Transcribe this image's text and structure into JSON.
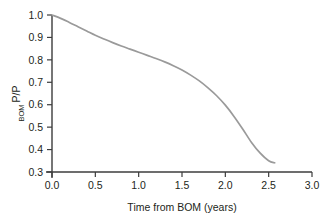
{
  "chart_data": {
    "type": "line",
    "title": "",
    "subtitle": "",
    "xlabel": "Time from BOM (years)",
    "ylabel_main": "P/P",
    "ylabel_sub": "BOM",
    "ylabel": "P/P_BOM",
    "xlim": [
      0.0,
      3.0
    ],
    "ylim": [
      0.3,
      1.0
    ],
    "grid": false,
    "legend": "none",
    "line_color": "#9a9a9a",
    "axis_color": "#3c3c3c",
    "text_color": "#231f20",
    "xticks": [
      "0.0",
      "0.5",
      "1.0",
      "1.5",
      "2.0",
      "2.5",
      "3.0"
    ],
    "xtick_values": [
      0.0,
      0.5,
      1.0,
      1.5,
      2.0,
      2.5,
      3.0
    ],
    "yticks": [
      "0.3",
      "0.4",
      "0.5",
      "0.6",
      "0.7",
      "0.8",
      "0.9",
      "1.0"
    ],
    "ytick_values": [
      0.3,
      0.4,
      0.5,
      0.6,
      0.7,
      0.8,
      0.9,
      1.0
    ],
    "series": [
      {
        "name": "P/P_BOM decline",
        "x": [
          0.0,
          0.1,
          0.2,
          0.3,
          0.4,
          0.5,
          0.6,
          0.7,
          0.8,
          0.9,
          1.0,
          1.1,
          1.2,
          1.3,
          1.4,
          1.5,
          1.6,
          1.7,
          1.8,
          1.9,
          2.0,
          2.1,
          2.2,
          2.3,
          2.4,
          2.5,
          2.57
        ],
        "values": [
          1.0,
          0.985,
          0.967,
          0.948,
          0.929,
          0.91,
          0.893,
          0.877,
          0.862,
          0.848,
          0.834,
          0.82,
          0.806,
          0.791,
          0.774,
          0.755,
          0.732,
          0.706,
          0.675,
          0.64,
          0.598,
          0.548,
          0.492,
          0.433,
          0.385,
          0.35,
          0.341
        ]
      }
    ]
  }
}
